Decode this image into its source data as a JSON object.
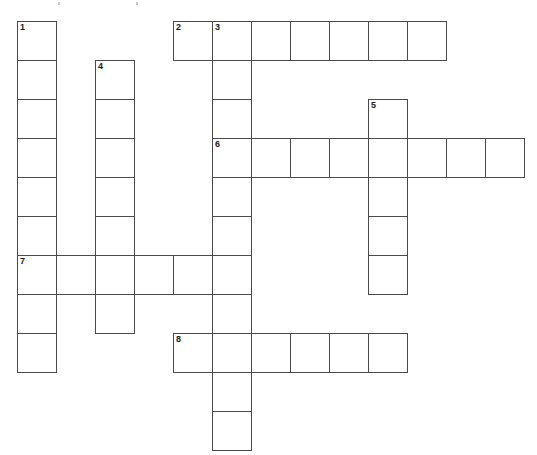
{
  "puzzle": {
    "title": "Crossword Grid",
    "cell_size": 39,
    "origin": {
      "x": 17,
      "y": 21
    },
    "grid_columns": 13,
    "grid_rows": 11,
    "ink_color": "#4a4a4a",
    "cell_fill": "#ffffff",
    "number_color": "#1a1a1a",
    "background": "#ffffff",
    "entries": [
      {
        "number": 1,
        "direction": "down",
        "row": 0,
        "col": 0,
        "length": 9
      },
      {
        "number": 2,
        "direction": "across",
        "row": 0,
        "col": 4,
        "length": 7
      },
      {
        "number": 3,
        "direction": "down",
        "row": 0,
        "col": 5,
        "length": 11
      },
      {
        "number": 4,
        "direction": "down",
        "row": 1,
        "col": 2,
        "length": 7
      },
      {
        "number": 5,
        "direction": "down",
        "row": 2,
        "col": 9,
        "length": 5
      },
      {
        "number": 6,
        "direction": "across",
        "row": 3,
        "col": 5,
        "length": 8
      },
      {
        "number": 7,
        "direction": "across",
        "row": 6,
        "col": 0,
        "length": 6
      },
      {
        "number": 8,
        "direction": "across",
        "row": 8,
        "col": 4,
        "length": 6
      }
    ],
    "cells": [
      {
        "row": 0,
        "col": 0,
        "number": "1",
        "letter": ""
      },
      {
        "row": 1,
        "col": 0,
        "number": "",
        "letter": ""
      },
      {
        "row": 2,
        "col": 0,
        "number": "",
        "letter": ""
      },
      {
        "row": 3,
        "col": 0,
        "number": "",
        "letter": ""
      },
      {
        "row": 4,
        "col": 0,
        "number": "",
        "letter": ""
      },
      {
        "row": 5,
        "col": 0,
        "number": "",
        "letter": ""
      },
      {
        "row": 6,
        "col": 0,
        "number": "7",
        "letter": ""
      },
      {
        "row": 7,
        "col": 0,
        "number": "",
        "letter": ""
      },
      {
        "row": 8,
        "col": 0,
        "number": "",
        "letter": ""
      },
      {
        "row": 1,
        "col": 2,
        "number": "4",
        "letter": ""
      },
      {
        "row": 2,
        "col": 2,
        "number": "",
        "letter": ""
      },
      {
        "row": 3,
        "col": 2,
        "number": "",
        "letter": ""
      },
      {
        "row": 4,
        "col": 2,
        "number": "",
        "letter": ""
      },
      {
        "row": 5,
        "col": 2,
        "number": "",
        "letter": ""
      },
      {
        "row": 6,
        "col": 2,
        "number": "",
        "letter": ""
      },
      {
        "row": 7,
        "col": 2,
        "number": "",
        "letter": ""
      },
      {
        "row": 6,
        "col": 1,
        "number": "",
        "letter": ""
      },
      {
        "row": 6,
        "col": 3,
        "number": "",
        "letter": ""
      },
      {
        "row": 6,
        "col": 4,
        "number": "",
        "letter": ""
      },
      {
        "row": 6,
        "col": 5,
        "number": "",
        "letter": ""
      },
      {
        "row": 0,
        "col": 4,
        "number": "2",
        "letter": ""
      },
      {
        "row": 0,
        "col": 5,
        "number": "3",
        "letter": ""
      },
      {
        "row": 0,
        "col": 6,
        "number": "",
        "letter": ""
      },
      {
        "row": 0,
        "col": 7,
        "number": "",
        "letter": ""
      },
      {
        "row": 0,
        "col": 8,
        "number": "",
        "letter": ""
      },
      {
        "row": 0,
        "col": 9,
        "number": "",
        "letter": ""
      },
      {
        "row": 0,
        "col": 10,
        "number": "",
        "letter": ""
      },
      {
        "row": 1,
        "col": 5,
        "number": "",
        "letter": ""
      },
      {
        "row": 2,
        "col": 5,
        "number": "",
        "letter": ""
      },
      {
        "row": 3,
        "col": 5,
        "number": "6",
        "letter": ""
      },
      {
        "row": 4,
        "col": 5,
        "number": "",
        "letter": ""
      },
      {
        "row": 5,
        "col": 5,
        "number": "",
        "letter": ""
      },
      {
        "row": 7,
        "col": 5,
        "number": "",
        "letter": ""
      },
      {
        "row": 8,
        "col": 5,
        "number": "",
        "letter": ""
      },
      {
        "row": 9,
        "col": 5,
        "number": "",
        "letter": ""
      },
      {
        "row": 10,
        "col": 5,
        "number": "",
        "letter": ""
      },
      {
        "row": 3,
        "col": 6,
        "number": "",
        "letter": ""
      },
      {
        "row": 3,
        "col": 7,
        "number": "",
        "letter": ""
      },
      {
        "row": 3,
        "col": 8,
        "number": "",
        "letter": ""
      },
      {
        "row": 3,
        "col": 9,
        "number": "",
        "letter": ""
      },
      {
        "row": 3,
        "col": 10,
        "number": "",
        "letter": ""
      },
      {
        "row": 3,
        "col": 11,
        "number": "",
        "letter": ""
      },
      {
        "row": 3,
        "col": 12,
        "number": "",
        "letter": ""
      },
      {
        "row": 2,
        "col": 9,
        "number": "5",
        "letter": ""
      },
      {
        "row": 4,
        "col": 9,
        "number": "",
        "letter": ""
      },
      {
        "row": 5,
        "col": 9,
        "number": "",
        "letter": ""
      },
      {
        "row": 6,
        "col": 9,
        "number": "",
        "letter": ""
      },
      {
        "row": 8,
        "col": 4,
        "number": "8",
        "letter": ""
      },
      {
        "row": 8,
        "col": 6,
        "number": "",
        "letter": ""
      },
      {
        "row": 8,
        "col": 7,
        "number": "",
        "letter": ""
      },
      {
        "row": 8,
        "col": 8,
        "number": "",
        "letter": ""
      },
      {
        "row": 8,
        "col": 9,
        "number": "",
        "letter": ""
      }
    ],
    "specks": [
      {
        "x": 58,
        "y": 2
      },
      {
        "x": 136,
        "y": 2
      }
    ]
  }
}
